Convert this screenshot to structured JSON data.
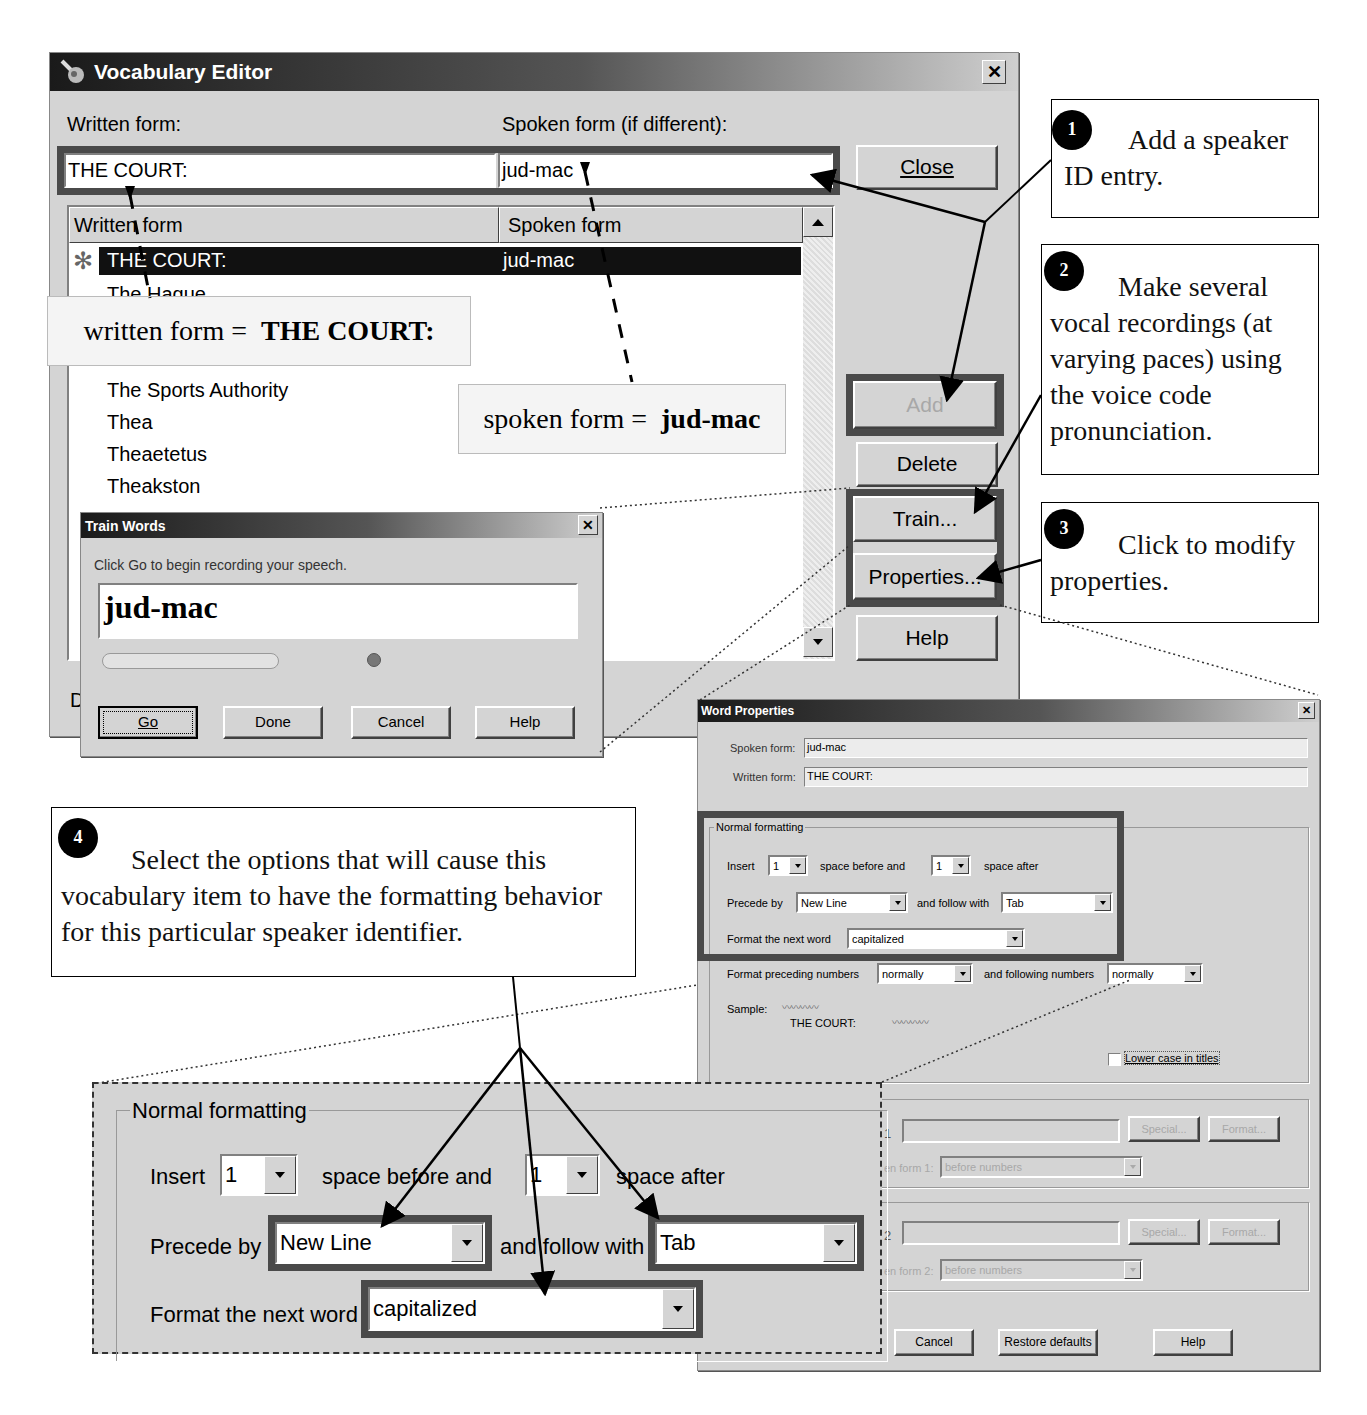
{
  "vocab_editor": {
    "title": "Vocabulary Editor",
    "written_label": "Written form:",
    "spoken_label": "Spoken form (if different):",
    "written_value": "THE COURT:",
    "spoken_value": "jud-mac",
    "list_headers": [
      "Written form",
      "Spoken form"
    ],
    "list_rows": [
      {
        "written": "THE COURT:",
        "spoken": "jud-mac",
        "selected": true
      },
      {
        "written": "The Hague",
        "spoken": ""
      },
      {
        "written": "The Sports Authority",
        "spoken": ""
      },
      {
        "written": "Thea",
        "spoken": ""
      },
      {
        "written": "Theaetetus",
        "spoken": ""
      },
      {
        "written": "Theakston",
        "spoken": ""
      }
    ],
    "buttons": {
      "close": "Close",
      "add": "Add",
      "delete": "Delete",
      "train": "Train...",
      "properties": "Properties...",
      "help": "Help"
    },
    "bottom_clip_text": "D"
  },
  "annotations": {
    "written_form_label": "written form = ",
    "written_form_value": "THE COURT:",
    "spoken_form_label": "spoken form = ",
    "spoken_form_value": "jud-mac"
  },
  "callouts": [
    {
      "number": "1",
      "text": "Add a speaker ID entry."
    },
    {
      "number": "2",
      "text": "Make several vocal recordings (at varying paces) using the voice code pronunciation."
    },
    {
      "number": "3",
      "text": "Click to modify properties."
    },
    {
      "number": "4",
      "text": "Select the options that will cause this vocabulary item to have the formatting behavior for this particular speaker identifier."
    }
  ],
  "train_words": {
    "title": "Train Words",
    "instruction": "Click Go to begin recording your speech.",
    "word": "jud-mac",
    "buttons": {
      "go": "Go",
      "done": "Done",
      "cancel": "Cancel",
      "help": "Help"
    }
  },
  "word_properties": {
    "title": "Word Properties",
    "spoken_label": "Spoken form:",
    "spoken_value": "jud-mac",
    "written_label": "Written form:",
    "written_value": "THE COURT:",
    "group_label": "Normal formatting",
    "insert_label": "Insert",
    "space_before_value": "1",
    "space_before_label": "space before and",
    "space_after_value": "1",
    "space_after_label": "space after",
    "precede_label": "Precede by",
    "precede_value": "New Line",
    "follow_label": "and follow with",
    "follow_value": "Tab",
    "format_next_label": "Format the next word",
    "format_next_value": "capitalized",
    "format_preceding_label": "Format preceding numbers",
    "format_preceding_value": "normally",
    "following_numbers_label": "and following numbers",
    "following_numbers_value": "normally",
    "sample_label": "Sample:",
    "sample_text": "THE COURT:",
    "lower_case_label": "Lower case in titles",
    "lower_case_checked": false,
    "alt1_marker": "1",
    "alt2_marker": "2",
    "special_label": "Special...",
    "format_label": "Format...",
    "alt_form1_label": "en form 1:",
    "alt_form2_label": "en form 2:",
    "alt_select_value": "before numbers",
    "buttons": {
      "cancel": "Cancel",
      "restore": "Restore defaults",
      "help": "Help"
    }
  },
  "zoomed_formatting": {
    "group_label": "Normal formatting",
    "insert_label": "Insert",
    "space_before_value": "1",
    "space_before_label": "space before and",
    "space_after_value": "1",
    "space_after_label": "space after",
    "precede_label": "Precede by",
    "precede_value": "New Line",
    "follow_label": "and follow with",
    "follow_value": "Tab",
    "format_next_label": "Format the next word",
    "format_next_value": "capitalized"
  }
}
